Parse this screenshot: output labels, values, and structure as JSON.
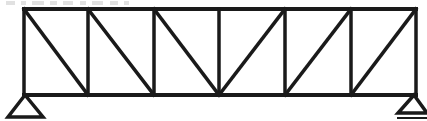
{
  "figure": {
    "kind": "line-drawing",
    "width": 427,
    "height": 121,
    "background_color": "#ffffff",
    "stroke_color": "#1a1a1a"
  },
  "diagram_data": {
    "type": "structural-truss",
    "truss_style": "Pratt truss with central apex",
    "panel_count": 6,
    "span_px": 392,
    "height_px": 86,
    "top_chord": {
      "y": 9,
      "x_start": 24,
      "x_end": 416,
      "stroke_width": 4
    },
    "bottom_chord": {
      "y": 95,
      "x_start": 24,
      "x_end": 416,
      "stroke_width": 4
    },
    "verticals": [
      {
        "name": "vertical-0-left-end",
        "x": 24,
        "y_top": 9,
        "y_bottom": 95
      },
      {
        "name": "vertical-1",
        "x": 88,
        "y_top": 9,
        "y_bottom": 95
      },
      {
        "name": "vertical-2",
        "x": 154,
        "y_top": 9,
        "y_bottom": 95
      },
      {
        "name": "vertical-3-midspan",
        "x": 219,
        "y_top": 9,
        "y_bottom": 95
      },
      {
        "name": "vertical-4",
        "x": 285,
        "y_top": 9,
        "y_bottom": 95
      },
      {
        "name": "vertical-5",
        "x": 351,
        "y_top": 9,
        "y_bottom": 95
      },
      {
        "name": "vertical-6-right-end",
        "x": 416,
        "y_top": 9,
        "y_bottom": 95
      }
    ],
    "diagonals": [
      {
        "name": "diagonal-panel-1",
        "direction": "descending",
        "x1": 24,
        "y1": 9,
        "x2": 88,
        "y2": 95
      },
      {
        "name": "diagonal-panel-2",
        "direction": "descending",
        "x1": 88,
        "y1": 9,
        "x2": 154,
        "y2": 95
      },
      {
        "name": "diagonal-panel-3",
        "direction": "descending",
        "x1": 154,
        "y1": 9,
        "x2": 219,
        "y2": 95
      },
      {
        "name": "diagonal-panel-4",
        "direction": "ascending",
        "x1": 219,
        "y1": 95,
        "x2": 285,
        "y2": 9
      },
      {
        "name": "diagonal-panel-5",
        "direction": "ascending",
        "x1": 285,
        "y1": 95,
        "x2": 351,
        "y2": 9
      },
      {
        "name": "diagonal-panel-6",
        "direction": "ascending",
        "x1": 351,
        "y1": 95,
        "x2": 416,
        "y2": 9
      }
    ],
    "supports": [
      {
        "name": "support-left-pin",
        "type": "pin",
        "apex_x": 25,
        "apex_y": 95,
        "base_y": 117,
        "base_x_left": 8,
        "base_x_right": 43,
        "has_ground_line": false
      },
      {
        "name": "support-right-roller",
        "type": "roller",
        "apex_x": 414,
        "apex_y": 95,
        "base_y": 113,
        "base_x_left": 398,
        "base_x_right": 427,
        "has_ground_line": true,
        "ground_line_y": 118,
        "ground_line_x_left": 398,
        "ground_line_x_right": 427
      }
    ],
    "edge_artifacts": {
      "description": "faint clipped text remnants along the very top edge of the crop",
      "marks": [
        {
          "x": 6,
          "width": 9
        },
        {
          "x": 21,
          "width": 5
        },
        {
          "x": 32,
          "width": 12
        },
        {
          "x": 50,
          "width": 7
        },
        {
          "x": 63,
          "width": 10
        },
        {
          "x": 80,
          "width": 6
        },
        {
          "x": 92,
          "width": 11
        },
        {
          "x": 110,
          "width": 8
        },
        {
          "x": 124,
          "width": 5
        }
      ]
    }
  }
}
